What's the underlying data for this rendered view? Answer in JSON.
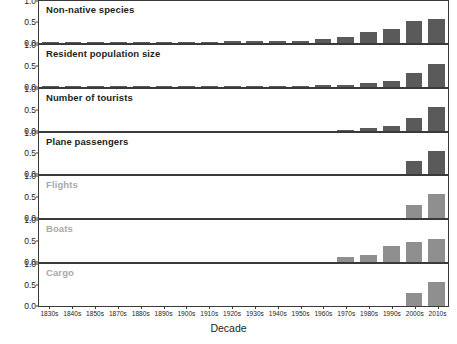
{
  "chart_data": {
    "type": "bar",
    "title": "",
    "xlabel": "Decade",
    "ylabel": "",
    "ylim": [
      0,
      1.0
    ],
    "yticks": [
      "0.0",
      "0.5",
      "1.0"
    ],
    "grid": false,
    "legend": "none",
    "layout": "small-multiples, 7 stacked panels sharing one x-axis",
    "categories": [
      "1830s",
      "1840s",
      "1850s",
      "1870s",
      "1880s",
      "1890s",
      "1900s",
      "1910s",
      "1920s",
      "1930s",
      "1940s",
      "1950s",
      "1960s",
      "1970s",
      "1980s",
      "1990s",
      "2000s",
      "2010s"
    ],
    "series": [
      {
        "name": "Non-native species",
        "shade": "dark",
        "values": [
          0.01,
          0.01,
          0.01,
          0.02,
          0.02,
          0.02,
          0.03,
          0.03,
          0.04,
          0.04,
          0.05,
          0.05,
          0.09,
          0.14,
          0.25,
          0.32,
          0.53,
          0.56
        ]
      },
      {
        "name": "Resident population size",
        "shade": "dark",
        "values": [
          0.005,
          0.005,
          0.005,
          0.005,
          0.005,
          0.005,
          0.005,
          0.01,
          0.01,
          0.01,
          0.02,
          0.02,
          0.03,
          0.05,
          0.08,
          0.13,
          0.33,
          0.54
        ]
      },
      {
        "name": "Number of tourists",
        "shade": "dark",
        "values": [
          0,
          0,
          0,
          0,
          0,
          0,
          0,
          0,
          0,
          0,
          0,
          0,
          0,
          0.02,
          0.05,
          0.11,
          0.3,
          0.57
        ]
      },
      {
        "name": "Plane passengers",
        "shade": "dark",
        "values": [
          0,
          0,
          0,
          0,
          0,
          0,
          0,
          0,
          0,
          0,
          0,
          0,
          0,
          0,
          0,
          0,
          0.33,
          0.57
        ]
      },
      {
        "name": "Flights",
        "shade": "light",
        "values": [
          0,
          0,
          0,
          0,
          0,
          0,
          0,
          0,
          0,
          0,
          0,
          0,
          0,
          0,
          0,
          0,
          0.32,
          0.57
        ]
      },
      {
        "name": "Boats",
        "shade": "light",
        "values": [
          0,
          0,
          0,
          0,
          0,
          0,
          0,
          0,
          0,
          0,
          0,
          0,
          0,
          0.13,
          0.17,
          0.38,
          0.47,
          0.56
        ]
      },
      {
        "name": "Cargo",
        "shade": "light",
        "values": [
          0,
          0,
          0,
          0,
          0,
          0,
          0,
          0,
          0,
          0,
          0,
          0,
          0,
          0,
          0,
          0,
          0.31,
          0.57
        ]
      }
    ],
    "colors": {
      "bar_dark": "#5a5a5a",
      "bar_light": "#8f8f8f",
      "axis": "#3a3a3a",
      "title_dark": "#231f20",
      "title_light": "#a9a9a9",
      "background": "#ffffff"
    }
  }
}
